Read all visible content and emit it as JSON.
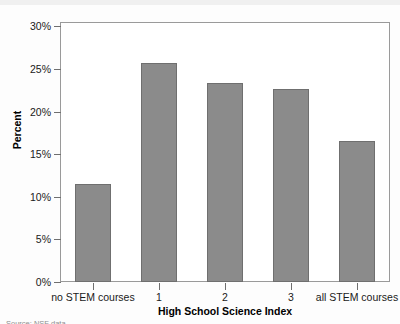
{
  "chart_data": {
    "type": "bar",
    "title": "",
    "xlabel": "High School Science Index",
    "ylabel": "Percent",
    "categories": [
      "no STEM courses",
      "1",
      "2",
      "3",
      "all STEM courses"
    ],
    "values": [
      11.5,
      25.7,
      23.4,
      22.6,
      16.6
    ],
    "value_labels": [
      "11.5%",
      "25.7%",
      "23.4%",
      "22.6%",
      "16.6%"
    ],
    "ylim": [
      0,
      30.5
    ],
    "yticks": [
      0,
      5,
      10,
      15,
      20,
      25,
      30
    ],
    "ytick_labels": [
      "0%",
      "5%",
      "10%",
      "15%",
      "20%",
      "25%",
      "30%"
    ],
    "grid": false,
    "legend": null,
    "bar_color": "#8b8b8b",
    "bar_border_color": "#6f6f6f",
    "frame_color": "#9a9a9a",
    "text_color": "#1a1a1a"
  },
  "footer": {
    "source_note": "Source: NSF data"
  }
}
